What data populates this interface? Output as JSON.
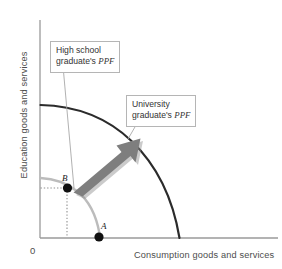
{
  "figure": {
    "type": "ppf-economic-growth-diagram",
    "background_color": "#ffffff"
  },
  "axes": {
    "y_title": "Education goods and services",
    "x_title": "Consumption goods and services",
    "origin_label": "0",
    "axis_color": "#9a9a9a",
    "title_color": "#4d4d4d"
  },
  "callouts": [
    {
      "id": "high-school",
      "line1": "High school",
      "line2_prefix": "graduate's ",
      "line2_abbrev": "PPF",
      "border_color": "#b5b5b5"
    },
    {
      "id": "university",
      "line1": "University",
      "line2_prefix": "graduate's ",
      "line2_abbrev": "PPF",
      "border_color": "#b5b5b5"
    }
  ],
  "points": [
    {
      "id": "A",
      "label": "A",
      "on_curve": "high-school-ppf",
      "position": "x-axis-intercept-region"
    },
    {
      "id": "B",
      "label": "B",
      "on_curve": "high-school-ppf",
      "position": "interior-of-curve"
    }
  ],
  "curves": [
    {
      "id": "high-school-ppf",
      "label": "High school graduate's PPF",
      "color": "#b9b9b9",
      "stroke_width": 2.4,
      "description": "inner concave quarter arc"
    },
    {
      "id": "university-ppf",
      "label": "University graduate's PPF",
      "color": "#2b2b2b",
      "stroke_width": 2.2,
      "description": "outer concave quarter arc"
    }
  ],
  "arrow": {
    "id": "growth-arrow",
    "color": "#7e7e7e",
    "description": "thick arrow from point B pointing up and to the right toward the outer PPF"
  },
  "guides": {
    "color": "#8f8f8f",
    "style": "dotted",
    "description": "dotted lines from point B to both axes"
  }
}
